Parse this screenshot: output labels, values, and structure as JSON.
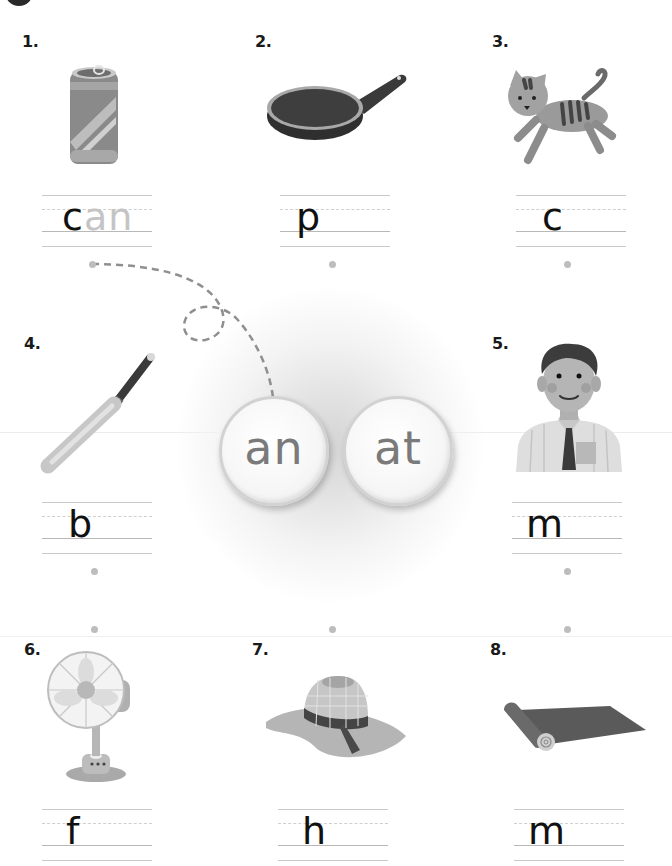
{
  "worksheet": {
    "word_families": [
      {
        "label": "an"
      },
      {
        "label": "at"
      }
    ],
    "items": [
      {
        "number": "1.",
        "picture": "soda-can",
        "given": "c",
        "trace": "an"
      },
      {
        "number": "2.",
        "picture": "frying-pan",
        "given": "p",
        "trace": ""
      },
      {
        "number": "3.",
        "picture": "cat",
        "given": "c",
        "trace": ""
      },
      {
        "number": "4.",
        "picture": "baseball-bat",
        "given": "b",
        "trace": ""
      },
      {
        "number": "5.",
        "picture": "man",
        "given": "m",
        "trace": ""
      },
      {
        "number": "6.",
        "picture": "electric-fan",
        "given": "f",
        "trace": ""
      },
      {
        "number": "7.",
        "picture": "sun-hat",
        "given": "h",
        "trace": ""
      },
      {
        "number": "8.",
        "picture": "rolled-mat",
        "given": "m",
        "trace": ""
      }
    ]
  },
  "colors": {
    "text": "#111111",
    "trace": "#c4c4c4",
    "chip_text": "#7a7a7a",
    "dash": "#8f8f8f"
  }
}
